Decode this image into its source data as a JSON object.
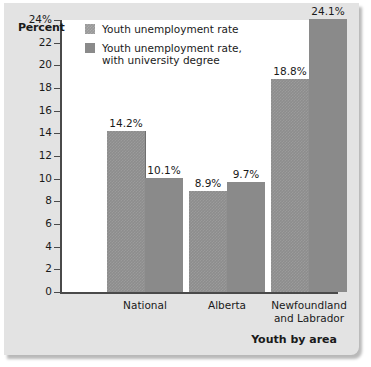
{
  "chart_data": {
    "type": "bar",
    "title": "",
    "xlabel": "Youth by area",
    "ylabel": "Percent",
    "ylim": [
      0,
      24
    ],
    "ytick_labels": [
      "24%",
      "22",
      "20",
      "18",
      "16",
      "14",
      "12",
      "10",
      "8",
      "6",
      "4",
      "2",
      "0"
    ],
    "ytick_values": [
      24,
      22,
      20,
      18,
      16,
      14,
      12,
      10,
      8,
      6,
      4,
      2,
      0
    ],
    "grid": false,
    "legend_position": "top-left-inside",
    "categories": [
      "National",
      "Alberta",
      "Newfoundland and Labrador"
    ],
    "category_lines": [
      [
        "National"
      ],
      [
        "Alberta"
      ],
      [
        "Newfoundland",
        "and Labrador"
      ]
    ],
    "series": [
      {
        "name": "Youth unemployment rate",
        "color": "#8d8d8d",
        "values": [
          14.2,
          8.9,
          18.8
        ],
        "labels": [
          "14.2%",
          "8.9%",
          "18.8%"
        ]
      },
      {
        "name": "Youth unemployment rate, with university degree",
        "name_lines": [
          "Youth unemployment rate,",
          "with university degree"
        ],
        "color": "#8a8a8a",
        "values": [
          10.1,
          9.7,
          24.1
        ],
        "labels": [
          "10.1%",
          "9.7%",
          "24.1%"
        ]
      }
    ]
  },
  "colors": {
    "card_background": "#e3e3e3",
    "plot_background": "#ffffff",
    "axis": "#4a4a4a",
    "text": "#1a1a1a"
  }
}
